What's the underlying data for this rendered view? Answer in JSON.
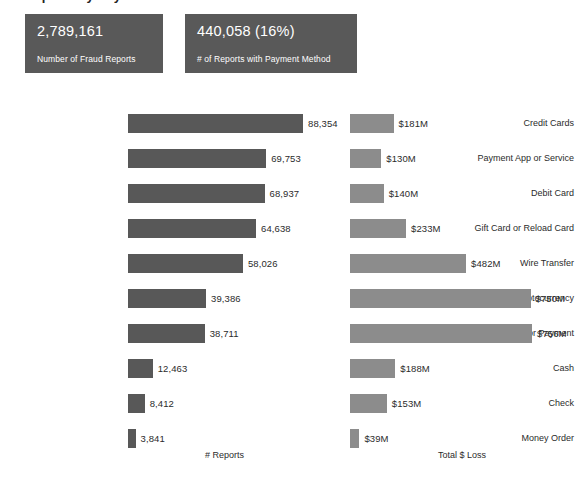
{
  "title_sliver": "Reports by Payment Method",
  "kpi": {
    "cards": [
      {
        "value": "2,789,161",
        "label": "Number of Fraud Reports"
      },
      {
        "value": "440,058  (16%)",
        "label": "# of Reports with Payment Method"
      }
    ]
  },
  "axis": {
    "reports_caption": "# Reports",
    "loss_caption": "Total $ Loss"
  },
  "colors": {
    "card_bg": "#595959",
    "reports_bar": "#585858",
    "loss_bar": "#8c8c8c",
    "text": "#2b2b2b",
    "page_bg": "#ffffff"
  },
  "chart_data": {
    "type": "bar",
    "title": "Reports by Payment Method",
    "orientation": "horizontal",
    "grid": false,
    "legend": null,
    "categories": [
      "Credit Cards",
      "Payment App or Service",
      "Debit Card",
      "Gift Card or Reload Card",
      "Wire Transfer",
      "Cryptocurrency",
      "Bank Transfer or Payment",
      "Cash",
      "Check",
      "Money Order"
    ],
    "series": [
      {
        "name": "# Reports",
        "xlabel": "# Reports",
        "color": "#585858",
        "values": [
          88354,
          69753,
          68937,
          64638,
          58026,
          39386,
          38711,
          12463,
          8412,
          3841
        ],
        "labels": [
          "88,354",
          "69,753",
          "68,937",
          "64,638",
          "58,026",
          "39,386",
          "38,711",
          "12,463",
          "8,412",
          "3,841"
        ],
        "xlim": [
          0,
          88354
        ]
      },
      {
        "name": "Total $ Loss",
        "xlabel": "Total $ Loss",
        "color": "#8c8c8c",
        "values": [
          181,
          130,
          140,
          233,
          482,
          750,
          756,
          188,
          153,
          39
        ],
        "units": "millions of dollars",
        "labels": [
          "$181M",
          "$130M",
          "$140M",
          "$233M",
          "$482M",
          "$750M",
          "$756M",
          "$188M",
          "$153M",
          "$39M"
        ],
        "xlim": [
          0,
          756
        ]
      }
    ]
  }
}
